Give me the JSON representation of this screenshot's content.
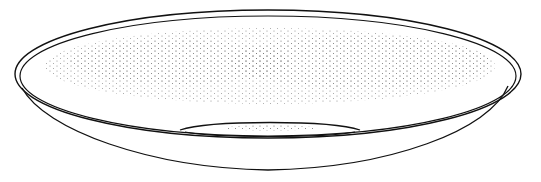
{
  "figure": {
    "colors": {
      "line": "#111111",
      "stipple": "#555555",
      "background": "#ffffff"
    },
    "width": 541,
    "height": 182
  }
}
